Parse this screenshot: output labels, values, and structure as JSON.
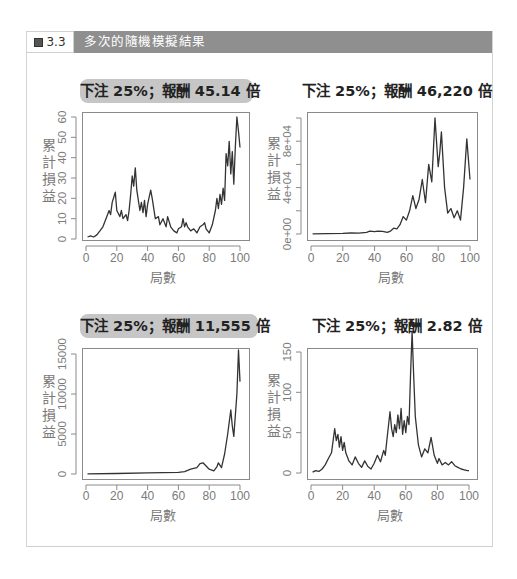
{
  "figure": {
    "label": "圖 3.3",
    "title": "多次的隨機模擬結果",
    "header_color": "#8f8f8f"
  },
  "chart_data": [
    {
      "type": "line",
      "title": "下注 25%；報酬 45.14 倍",
      "title_highlight": true,
      "xlabel": "局數",
      "ylabel": "累計損益",
      "xlim": [
        0,
        100
      ],
      "ylim": [
        0,
        60
      ],
      "xticks": [
        "0",
        "20",
        "40",
        "60",
        "80",
        "100"
      ],
      "yticks": [
        "0",
        "10",
        "20",
        "30",
        "40",
        "50",
        "60"
      ],
      "ytick_values": [
        0,
        10,
        20,
        30,
        40,
        50,
        60
      ],
      "grid": false,
      "x": [
        1,
        3,
        5,
        7,
        9,
        11,
        13,
        15,
        16,
        17,
        19,
        20,
        22,
        23,
        24,
        26,
        27,
        28,
        29,
        30,
        31,
        32,
        33,
        35,
        36,
        37,
        38,
        39,
        40,
        42,
        43,
        45,
        47,
        48,
        50,
        52,
        53,
        55,
        57,
        59,
        60,
        62,
        63,
        64,
        65,
        66,
        68,
        70,
        72,
        74,
        76,
        77,
        78,
        80,
        82,
        84,
        85,
        86,
        87,
        88,
        89,
        90,
        91,
        92,
        93,
        94,
        95,
        96,
        97,
        98,
        99,
        100
      ],
      "values": [
        1,
        1.5,
        1,
        2,
        4,
        6,
        10,
        14,
        12,
        18,
        23,
        14,
        11,
        14,
        10,
        12,
        9,
        14,
        22,
        31,
        26,
        35,
        24,
        14,
        18,
        13,
        19,
        11,
        17,
        24,
        20,
        10,
        11,
        7,
        10,
        6,
        11,
        6,
        4,
        3,
        5,
        6,
        10,
        6,
        8,
        6,
        4,
        5,
        3,
        6,
        7,
        8,
        5,
        3,
        7,
        14,
        20,
        15,
        22,
        17,
        25,
        19,
        42,
        36,
        48,
        32,
        43,
        27,
        46,
        60,
        53,
        45
      ],
      "color": "#333333"
    },
    {
      "type": "line",
      "title": "下注 25%；報酬 46,220 倍",
      "title_highlight": false,
      "xlabel": "局數",
      "ylabel": "累計損益",
      "xlim": [
        0,
        100
      ],
      "ylim": [
        0,
        100000
      ],
      "xticks": [
        "0",
        "20",
        "40",
        "60",
        "80",
        "100"
      ],
      "yticks": [
        "0e+00",
        "4e+04",
        "8e+04"
      ],
      "ytick_values": [
        0,
        20000,
        40000,
        60000,
        80000,
        100000
      ],
      "ytick_label_values": [
        0,
        40000,
        80000
      ],
      "grid": false,
      "x": [
        1,
        10,
        20,
        25,
        30,
        35,
        37,
        40,
        42,
        45,
        48,
        50,
        52,
        54,
        56,
        58,
        60,
        62,
        64,
        66,
        68,
        70,
        72,
        74,
        76,
        78,
        80,
        81,
        82,
        84,
        86,
        88,
        90,
        92,
        94,
        96,
        98,
        100
      ],
      "values": [
        200,
        300,
        500,
        900,
        700,
        1500,
        2500,
        2000,
        2500,
        2200,
        1500,
        2500,
        5000,
        4500,
        8000,
        15000,
        12000,
        20000,
        33000,
        22000,
        30000,
        47000,
        27000,
        60000,
        45000,
        100000,
        58000,
        70000,
        88000,
        40000,
        18000,
        22000,
        14000,
        20000,
        12000,
        40000,
        82000,
        47000
      ],
      "color": "#333333"
    },
    {
      "type": "line",
      "title": "下注 25%；報酬 11,555 倍",
      "title_highlight": true,
      "xlabel": "局數",
      "ylabel": "累計損益",
      "xlim": [
        0,
        100
      ],
      "ylim": [
        0,
        15500
      ],
      "xticks": [
        "0",
        "20",
        "40",
        "60",
        "80",
        "100"
      ],
      "yticks": [
        "0",
        "5000",
        "10000",
        "15000"
      ],
      "ytick_values": [
        0,
        5000,
        10000,
        15000
      ],
      "grid": false,
      "x": [
        1,
        20,
        40,
        60,
        64,
        68,
        72,
        74,
        76,
        78,
        80,
        83,
        85,
        86,
        88,
        90,
        92,
        94,
        95,
        96,
        98,
        99,
        100
      ],
      "values": [
        20,
        60,
        150,
        200,
        300,
        600,
        800,
        1300,
        1400,
        1000,
        600,
        400,
        900,
        1400,
        800,
        2500,
        5000,
        8000,
        6000,
        4700,
        10000,
        15500,
        11555
      ],
      "color": "#333333"
    },
    {
      "type": "line",
      "title": "下注 25%；報酬 2.82 倍",
      "title_highlight": false,
      "xlabel": "局數",
      "ylabel": "累計損益",
      "xlim": [
        0,
        100
      ],
      "ylim": [
        0,
        175
      ],
      "xticks": [
        "0",
        "20",
        "40",
        "60",
        "80",
        "100"
      ],
      "yticks": [
        "0",
        "50",
        "100",
        "150"
      ],
      "ytick_values": [
        0,
        50,
        100,
        150
      ],
      "grid": false,
      "x": [
        1,
        3,
        5,
        7,
        9,
        11,
        13,
        15,
        16,
        17,
        18,
        19,
        20,
        21,
        22,
        24,
        26,
        28,
        30,
        32,
        34,
        36,
        38,
        40,
        42,
        44,
        46,
        47,
        48,
        50,
        51,
        52,
        53,
        54,
        55,
        56,
        57,
        58,
        59,
        60,
        61,
        62,
        63,
        64,
        65,
        66,
        68,
        70,
        72,
        74,
        76,
        78,
        80,
        81,
        83,
        85,
        87,
        89,
        91,
        93,
        95,
        97,
        99,
        100
      ],
      "values": [
        1,
        3,
        2,
        5,
        10,
        18,
        25,
        55,
        40,
        48,
        32,
        45,
        28,
        38,
        25,
        15,
        10,
        20,
        12,
        7,
        15,
        8,
        5,
        12,
        22,
        14,
        28,
        22,
        40,
        76,
        55,
        45,
        60,
        50,
        72,
        55,
        80,
        48,
        65,
        50,
        70,
        60,
        120,
        175,
        120,
        70,
        35,
        20,
        30,
        25,
        44,
        22,
        12,
        18,
        10,
        13,
        10,
        14,
        9,
        7,
        5,
        4,
        3,
        3
      ],
      "color": "#333333"
    }
  ],
  "panels_layout": [
    {
      "pill": {
        "x": 80,
        "y": 79,
        "w": 173
      },
      "box": {
        "x": 82,
        "y": 112,
        "w": 167,
        "h": 128
      },
      "xtick0": 86,
      "xtick100": 240,
      "ytop": 117,
      "ybot": 239,
      "xlabels_y": 262,
      "xname_y": 282
    },
    {
      "pill": {
        "x": 302,
        "y": 79,
        "w": 188
      },
      "box": {
        "x": 307,
        "y": 112,
        "w": 170,
        "h": 128
      },
      "xtick0": 311,
      "xtick100": 470,
      "ytop": 118,
      "ybot": 234,
      "xlabels_y": 262,
      "xname_y": 282
    },
    {
      "pill": {
        "x": 80,
        "y": 314,
        "w": 178
      },
      "box": {
        "x": 82,
        "y": 348,
        "w": 167,
        "h": 131
      },
      "xtick0": 86,
      "xtick100": 240,
      "ytop": 354,
      "ybot": 474,
      "xlabels_y": 500,
      "xname_y": 520
    },
    {
      "pill": {
        "x": 312,
        "y": 314,
        "w": 168
      },
      "box": {
        "x": 307,
        "y": 348,
        "w": 170,
        "h": 131
      },
      "xtick0": 311,
      "xtick100": 469,
      "ytop": 352,
      "ybot": 473,
      "xlabels_y": 500,
      "xname_y": 520
    }
  ]
}
